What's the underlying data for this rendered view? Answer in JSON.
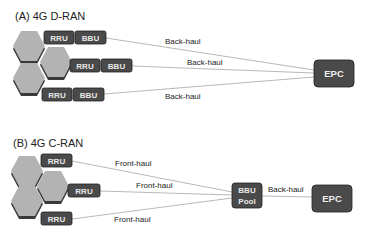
{
  "section_a": {
    "title": "(A) 4G D-RAN",
    "rows": [
      {
        "rru": "RRU",
        "bbu": "BBU",
        "link": "Back-haul"
      },
      {
        "rru": "RRU",
        "bbu": "BBU",
        "link": "Back-haul"
      },
      {
        "rru": "RRU",
        "bbu": "BBU",
        "link": "Back-haul"
      }
    ],
    "core": "EPC"
  },
  "section_b": {
    "title": "(B) 4G C-RAN",
    "rows": [
      {
        "rru": "RRU",
        "link": "Front-haul"
      },
      {
        "rru": "RRU",
        "link": "Front-haul"
      },
      {
        "rru": "RRU",
        "link": "Front-haul"
      }
    ],
    "pool_line1": "BBU",
    "pool_line2": "Pool",
    "pool_link": "Back-haul",
    "core": "EPC"
  },
  "colors": {
    "box": "#4a4a4a",
    "box_border": "#222222",
    "hex": "#b3b3b3",
    "hex_shadow": "#3c3c3c",
    "line": "#b8b8b8"
  }
}
